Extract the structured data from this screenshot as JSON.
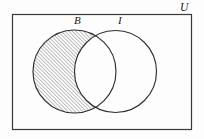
{
  "figure": {
    "kind": "venn-diagram",
    "background_color": "#fdfdfd",
    "stroke_color": "#3a3a3a",
    "hatch_color": "#4a4a4a"
  },
  "universe": {
    "name": "universal-set",
    "label": "U",
    "rect": {
      "x": 12,
      "y": 14,
      "width": 179,
      "height": 115
    },
    "label_position": {
      "x": 180,
      "y": 2
    }
  },
  "circles": [
    {
      "name": "set-B",
      "label": "B",
      "cx": 74.5,
      "cy": 71.5,
      "r": 41.5,
      "label_position": {
        "x": 74,
        "y": 15
      },
      "shaded": true
    },
    {
      "name": "set-I",
      "label": "I",
      "cx": 115.5,
      "cy": 71.5,
      "r": 41,
      "label_position": {
        "x": 118,
        "y": 15
      },
      "shaded": false
    }
  ],
  "shading": {
    "region": "B-minus-I",
    "pattern": "diagonal-hatch",
    "angle_degrees": 45,
    "spacing_px": 2.6,
    "line_width_px": 0.7
  },
  "chart_data": {
    "type": "diagram",
    "title": "",
    "sets": [
      "B",
      "I"
    ],
    "universe_label": "U",
    "highlighted_region": "B \\ I",
    "regions": [
      {
        "id": "B-only",
        "label": "B \\ I",
        "shaded": true
      },
      {
        "id": "B-and-I",
        "label": "B ∩ I",
        "shaded": false
      },
      {
        "id": "I-only",
        "label": "I \\ B",
        "shaded": false
      },
      {
        "id": "outside",
        "label": "U \\ (B ∪ I)",
        "shaded": false
      }
    ]
  }
}
